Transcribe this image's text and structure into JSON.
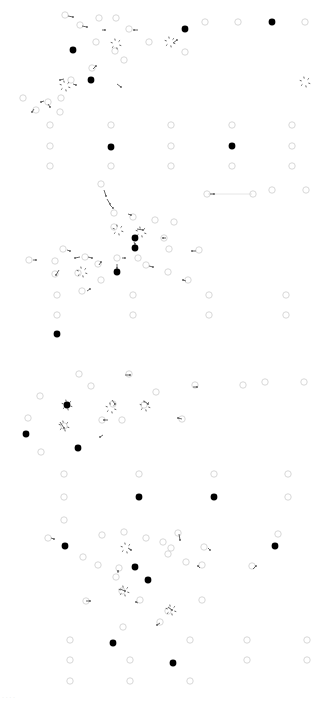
{
  "diagram": {
    "type": "network-node-link",
    "background": "#ffffff",
    "colors": {
      "hollow_node_stroke": "#d8d8d8",
      "filled_node": "#000000",
      "arrow": "#555555",
      "edge": "#e6e6e6",
      "caption": "#e4e4e4"
    },
    "caption": "· · · ·",
    "filled_nodes": [
      [
        185,
        29
      ],
      [
        272,
        22
      ],
      [
        73,
        50
      ],
      [
        91,
        80
      ],
      [
        111,
        147
      ],
      [
        232,
        146
      ],
      [
        135,
        238
      ],
      [
        135,
        248
      ],
      [
        117,
        272
      ],
      [
        57,
        334
      ],
      [
        67,
        405
      ],
      [
        26,
        434
      ],
      [
        78,
        448
      ],
      [
        139,
        497
      ],
      [
        214,
        497
      ],
      [
        65,
        546
      ],
      [
        275,
        546
      ],
      [
        135,
        567
      ],
      [
        148,
        580
      ],
      [
        113,
        643
      ],
      [
        173,
        663
      ]
    ],
    "hollow_nodes": [
      [
        65,
        15
      ],
      [
        80,
        25
      ],
      [
        99,
        18
      ],
      [
        116,
        18
      ],
      [
        129,
        29
      ],
      [
        149,
        42
      ],
      [
        96,
        42
      ],
      [
        115,
        51
      ],
      [
        124,
        60
      ],
      [
        92,
        68
      ],
      [
        71,
        80
      ],
      [
        61,
        98
      ],
      [
        48,
        102
      ],
      [
        36,
        110
      ],
      [
        60,
        112
      ],
      [
        23,
        98
      ],
      [
        205,
        22
      ],
      [
        238,
        22
      ],
      [
        305,
        22
      ],
      [
        185,
        52
      ],
      [
        50,
        125
      ],
      [
        111,
        125
      ],
      [
        171,
        125
      ],
      [
        232,
        125
      ],
      [
        292,
        125
      ],
      [
        50,
        146
      ],
      [
        171,
        146
      ],
      [
        292,
        146
      ],
      [
        50,
        166
      ],
      [
        111,
        166
      ],
      [
        171,
        166
      ],
      [
        232,
        166
      ],
      [
        292,
        166
      ],
      [
        101,
        184
      ],
      [
        114,
        213
      ],
      [
        207,
        194
      ],
      [
        253,
        194
      ],
      [
        272,
        190
      ],
      [
        306,
        190
      ],
      [
        133,
        217
      ],
      [
        155,
        220
      ],
      [
        174,
        222
      ],
      [
        114,
        227
      ],
      [
        164,
        238
      ],
      [
        169,
        249
      ],
      [
        199,
        250
      ],
      [
        63,
        249
      ],
      [
        85,
        257
      ],
      [
        117,
        258
      ],
      [
        29,
        260
      ],
      [
        55,
        261
      ],
      [
        98,
        264
      ],
      [
        146,
        265
      ],
      [
        138,
        258
      ],
      [
        55,
        274
      ],
      [
        78,
        273
      ],
      [
        168,
        272
      ],
      [
        101,
        280
      ],
      [
        188,
        280
      ],
      [
        82,
        291
      ],
      [
        57,
        295
      ],
      [
        133,
        295
      ],
      [
        209,
        295
      ],
      [
        286,
        295
      ],
      [
        57,
        315
      ],
      [
        133,
        315
      ],
      [
        209,
        315
      ],
      [
        286,
        315
      ],
      [
        79,
        374
      ],
      [
        129,
        374
      ],
      [
        195,
        385
      ],
      [
        91,
        386
      ],
      [
        40,
        396
      ],
      [
        156,
        392
      ],
      [
        243,
        385
      ],
      [
        265,
        382
      ],
      [
        304,
        382
      ],
      [
        113,
        404
      ],
      [
        144,
        405
      ],
      [
        28,
        418
      ],
      [
        102,
        420
      ],
      [
        122,
        420
      ],
      [
        182,
        419
      ],
      [
        64,
        426
      ],
      [
        41,
        452
      ],
      [
        64,
        474
      ],
      [
        139,
        474
      ],
      [
        214,
        474
      ],
      [
        288,
        474
      ],
      [
        64,
        497
      ],
      [
        288,
        497
      ],
      [
        64,
        520
      ],
      [
        48,
        538
      ],
      [
        102,
        535
      ],
      [
        124,
        532
      ],
      [
        146,
        538
      ],
      [
        163,
        542
      ],
      [
        178,
        533
      ],
      [
        171,
        548
      ],
      [
        204,
        547
      ],
      [
        278,
        534
      ],
      [
        83,
        557
      ],
      [
        98,
        565
      ],
      [
        119,
        568
      ],
      [
        168,
        554
      ],
      [
        186,
        562
      ],
      [
        202,
        565
      ],
      [
        252,
        566
      ],
      [
        116,
        577
      ],
      [
        86,
        601
      ],
      [
        122,
        591
      ],
      [
        140,
        600
      ],
      [
        202,
        600
      ],
      [
        168,
        611
      ],
      [
        160,
        622
      ],
      [
        123,
        627
      ],
      [
        70,
        640
      ],
      [
        190,
        640
      ],
      [
        247,
        640
      ],
      [
        307,
        640
      ],
      [
        70,
        660
      ],
      [
        130,
        660
      ],
      [
        247,
        660
      ],
      [
        307,
        660
      ],
      [
        70,
        681
      ],
      [
        130,
        681
      ],
      [
        190,
        681
      ]
    ],
    "star_clusters": [
      [
        116,
        44
      ],
      [
        305,
        82
      ],
      [
        170,
        42
      ],
      [
        118,
        230
      ],
      [
        65,
        86
      ],
      [
        141,
        232
      ],
      [
        82,
        272
      ],
      [
        67,
        405
      ],
      [
        64,
        426
      ],
      [
        111,
        408
      ],
      [
        145,
        406
      ],
      [
        126,
        548
      ],
      [
        124,
        591
      ],
      [
        171,
        610
      ]
    ],
    "arrows": [
      [
        68,
        16,
        73,
        17
      ],
      [
        82,
        26,
        87,
        27
      ],
      [
        102,
        30,
        105,
        30
      ],
      [
        138,
        30,
        134,
        30
      ],
      [
        173,
        43,
        177,
        40
      ],
      [
        93,
        69,
        96,
        66
      ],
      [
        73,
        84,
        76,
        85
      ],
      [
        64,
        79,
        60,
        80
      ],
      [
        44,
        101,
        41,
        102
      ],
      [
        48,
        104,
        50,
        107
      ],
      [
        34,
        109,
        32,
        112
      ],
      [
        117,
        84,
        121,
        87
      ],
      [
        104,
        190,
        106,
        196
      ],
      [
        107,
        199,
        110,
        204
      ],
      [
        110,
        205,
        113,
        208
      ],
      [
        210,
        194,
        214,
        194
      ],
      [
        128,
        214,
        131,
        215
      ],
      [
        137,
        229,
        143,
        230
      ],
      [
        134,
        242,
        135,
        244
      ],
      [
        122,
        258,
        125,
        258
      ],
      [
        80,
        257,
        75,
        258
      ],
      [
        88,
        257,
        92,
        258
      ],
      [
        33,
        260,
        36,
        260
      ],
      [
        67,
        250,
        70,
        251
      ],
      [
        99,
        265,
        101,
        262
      ],
      [
        117,
        264,
        117,
        268
      ],
      [
        149,
        266,
        153,
        267
      ],
      [
        59,
        270,
        56,
        275
      ],
      [
        87,
        291,
        90,
        289
      ],
      [
        186,
        281,
        183,
        280
      ],
      [
        166,
        238,
        163,
        238
      ],
      [
        196,
        251,
        192,
        251
      ],
      [
        125,
        375,
        130,
        375
      ],
      [
        193,
        387,
        197,
        387
      ],
      [
        112,
        400,
        115,
        404
      ],
      [
        144,
        401,
        148,
        404
      ],
      [
        108,
        420,
        104,
        420
      ],
      [
        60,
        422,
        64,
        428
      ],
      [
        103,
        435,
        100,
        437
      ],
      [
        182,
        419,
        178,
        418
      ],
      [
        51,
        538,
        54,
        539
      ],
      [
        128,
        548,
        131,
        550
      ],
      [
        179,
        534,
        180,
        540
      ],
      [
        208,
        548,
        210,
        550
      ],
      [
        253,
        569,
        256,
        566
      ],
      [
        118,
        573,
        118,
        571
      ],
      [
        86,
        601,
        90,
        601
      ],
      [
        120,
        589,
        125,
        591
      ],
      [
        138,
        603,
        136,
        602
      ],
      [
        168,
        607,
        172,
        610
      ],
      [
        160,
        623,
        157,
        625
      ],
      [
        200,
        568,
        198,
        566
      ]
    ],
    "edges": [
      [
        208,
        194,
        252,
        194
      ]
    ]
  }
}
